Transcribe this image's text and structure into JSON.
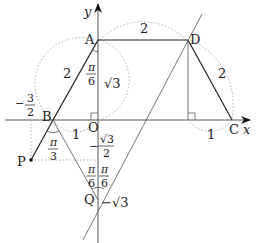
{
  "diagram": {
    "type": "geometry",
    "axes": {
      "x_label": "x",
      "y_label": "y"
    },
    "points": {
      "A": "A",
      "B": "B",
      "C": "C",
      "D": "D",
      "O": "O",
      "P": "P",
      "Q": "Q"
    },
    "lengths": {
      "AB": "2",
      "AD": "2",
      "DC": "2",
      "AO": "√3",
      "BO": "1",
      "C_foot": "1"
    },
    "angles": {
      "at_A": {
        "num": "π",
        "den": "6"
      },
      "at_B": {
        "num": "π",
        "den": "3"
      },
      "at_Q_left": {
        "num": "π",
        "den": "6"
      },
      "at_Q_right": {
        "num": "π",
        "den": "6"
      }
    },
    "coordinates": {
      "P_x": {
        "sign": "−",
        "num": "3",
        "den": "2"
      },
      "P_y": {
        "sign": "−",
        "num": "√3",
        "den": "2"
      },
      "Q_y": "−√3"
    }
  }
}
